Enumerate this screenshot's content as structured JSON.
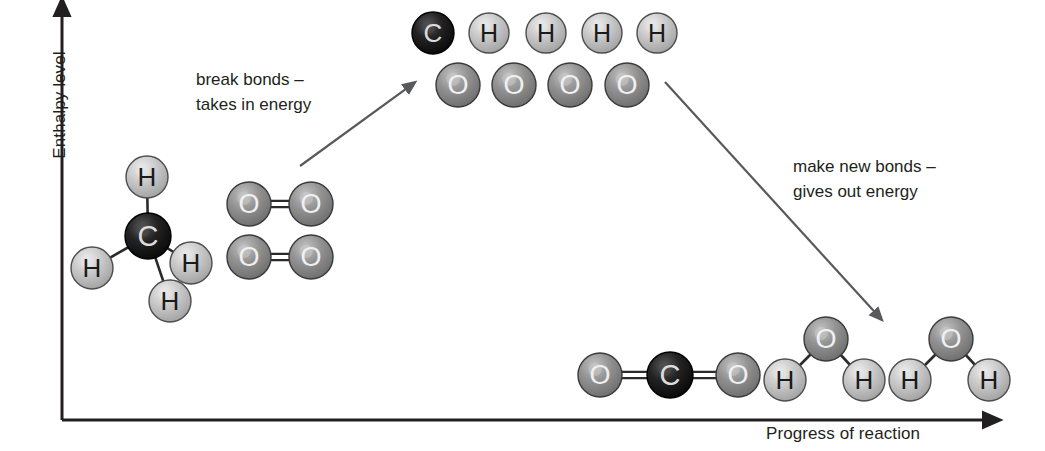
{
  "diagram": {
    "type": "reaction-energy-profile"
  },
  "axes": {
    "y_label": "Enthalpy level",
    "x_label": "Progress of reaction",
    "color": "#231f20",
    "origin": {
      "x": 62,
      "y": 420
    },
    "y_top": {
      "x": 62,
      "y": 8
    },
    "x_end": {
      "x": 992,
      "y": 420
    }
  },
  "annotations": [
    {
      "id": "break-bonds",
      "text": "break bonds –\ntakes in energy",
      "x": 196,
      "y": 67,
      "arrow": {
        "x1": 300,
        "y1": 166,
        "x2": 414,
        "y2": 83,
        "color": "#58595b"
      }
    },
    {
      "id": "make-bonds",
      "text": "make new bonds –\ngives out energy",
      "x": 793,
      "y": 154,
      "arrow": {
        "x1": 665,
        "y1": 82,
        "x2": 881,
        "y2": 319,
        "color": "#58595b"
      }
    }
  ],
  "atom_styles": {
    "C": {
      "label": "C",
      "fill": "#111111",
      "highlight": "#4a4a4a",
      "edge": "#000000",
      "text_color": "#dcdcdc",
      "radius": 21
    },
    "H": {
      "label": "H",
      "fill": "#bdbdbd",
      "highlight": "#e4e4e4",
      "edge": "#4d4d4d",
      "text_color": "#1a1a1a",
      "radius": 20
    },
    "O": {
      "label": "O",
      "fill": "#8c8c8c",
      "highlight": "#c9c9c9",
      "edge": "#3a3a3a",
      "text_color": "#f0f0f0",
      "radius": 22
    }
  },
  "molecules": [
    {
      "name": "methane-reactant",
      "formula": "CH4",
      "stage": "reactants",
      "atoms": [
        {
          "element": "C",
          "x": 148,
          "y": 236,
          "r": 23
        },
        {
          "element": "H",
          "x": 147,
          "y": 177,
          "r": 21
        },
        {
          "element": "H",
          "x": 92,
          "y": 268,
          "r": 21
        },
        {
          "element": "H",
          "x": 191,
          "y": 263,
          "r": 21
        },
        {
          "element": "H",
          "x": 170,
          "y": 301,
          "r": 21
        }
      ],
      "bonds": [
        {
          "a": 0,
          "b": 1,
          "order": 1
        },
        {
          "a": 0,
          "b": 2,
          "order": 1
        },
        {
          "a": 0,
          "b": 3,
          "order": 1
        },
        {
          "a": 0,
          "b": 4,
          "order": 1
        }
      ]
    },
    {
      "name": "oxygen-reactant-1",
      "formula": "O2",
      "stage": "reactants",
      "atoms": [
        {
          "element": "O",
          "x": 249,
          "y": 204,
          "r": 22
        },
        {
          "element": "O",
          "x": 311,
          "y": 204,
          "r": 22
        }
      ],
      "bonds": [
        {
          "a": 0,
          "b": 1,
          "order": 2
        }
      ]
    },
    {
      "name": "oxygen-reactant-2",
      "formula": "O2",
      "stage": "reactants",
      "atoms": [
        {
          "element": "O",
          "x": 249,
          "y": 257,
          "r": 22
        },
        {
          "element": "O",
          "x": 311,
          "y": 257,
          "r": 22
        }
      ],
      "bonds": [
        {
          "a": 0,
          "b": 1,
          "order": 2
        }
      ]
    },
    {
      "name": "separated-atoms-top-row",
      "formula": "C + 4H",
      "stage": "transition",
      "atoms": [
        {
          "element": "C",
          "x": 433,
          "y": 33,
          "r": 21
        },
        {
          "element": "H",
          "x": 489,
          "y": 33,
          "r": 20
        },
        {
          "element": "H",
          "x": 546,
          "y": 33,
          "r": 20
        },
        {
          "element": "H",
          "x": 602,
          "y": 33,
          "r": 20
        },
        {
          "element": "H",
          "x": 657,
          "y": 33,
          "r": 20
        }
      ],
      "bonds": []
    },
    {
      "name": "separated-atoms-bottom-row",
      "formula": "4O",
      "stage": "transition",
      "atoms": [
        {
          "element": "O",
          "x": 458,
          "y": 85,
          "r": 22
        },
        {
          "element": "O",
          "x": 514,
          "y": 85,
          "r": 22
        },
        {
          "element": "O",
          "x": 570,
          "y": 85,
          "r": 22
        },
        {
          "element": "O",
          "x": 627,
          "y": 85,
          "r": 22
        }
      ],
      "bonds": []
    },
    {
      "name": "carbon-dioxide-product",
      "formula": "CO2",
      "stage": "products",
      "atoms": [
        {
          "element": "O",
          "x": 600,
          "y": 375,
          "r": 22
        },
        {
          "element": "C",
          "x": 670,
          "y": 375,
          "r": 23
        },
        {
          "element": "O",
          "x": 738,
          "y": 375,
          "r": 22
        }
      ],
      "bonds": [
        {
          "a": 0,
          "b": 1,
          "order": 2
        },
        {
          "a": 1,
          "b": 2,
          "order": 2
        }
      ]
    },
    {
      "name": "water-product-1",
      "formula": "H2O",
      "stage": "products",
      "atoms": [
        {
          "element": "O",
          "x": 826,
          "y": 339,
          "r": 22
        },
        {
          "element": "H",
          "x": 785,
          "y": 380,
          "r": 21
        },
        {
          "element": "H",
          "x": 864,
          "y": 380,
          "r": 21
        }
      ],
      "bonds": [
        {
          "a": 0,
          "b": 1,
          "order": 1
        },
        {
          "a": 0,
          "b": 2,
          "order": 1
        }
      ]
    },
    {
      "name": "water-product-2",
      "formula": "H2O",
      "stage": "products",
      "atoms": [
        {
          "element": "O",
          "x": 951,
          "y": 339,
          "r": 22
        },
        {
          "element": "H",
          "x": 910,
          "y": 380,
          "r": 21
        },
        {
          "element": "H",
          "x": 989,
          "y": 380,
          "r": 21
        }
      ],
      "bonds": [
        {
          "a": 0,
          "b": 1,
          "order": 1
        },
        {
          "a": 0,
          "b": 2,
          "order": 1
        }
      ]
    }
  ],
  "chart_data": {
    "type": "diagram",
    "xlabel": "Progress of reaction",
    "ylabel": "Enthalpy level",
    "stages": [
      {
        "name": "reactants",
        "label": "CH4 + 2O2",
        "enthalpy_level": "low-middle"
      },
      {
        "name": "transition",
        "label": "C + 4H + 4O (separated atoms)",
        "enthalpy_level": "high"
      },
      {
        "name": "products",
        "label": "CO2 + 2H2O",
        "enthalpy_level": "lowest"
      }
    ],
    "annotations": [
      "break bonds – takes in energy",
      "make new bonds – gives out energy"
    ]
  }
}
